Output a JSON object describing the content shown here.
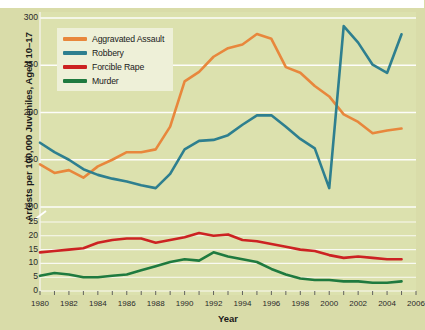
{
  "chart_data": {
    "type": "line",
    "title": "",
    "xlabel": "Year",
    "ylabel": "Arrests per 100,000 Juveniles, Aged 10–17",
    "xlim": [
      1980,
      2006
    ],
    "x_tick_labels": [
      "1980",
      "1982",
      "1984",
      "1986",
      "1988",
      "1990",
      "1992",
      "1994",
      "1996",
      "1998",
      "2000",
      "2002",
      "2004",
      "2006"
    ],
    "x_tick_values": [
      1980,
      1982,
      1984,
      1986,
      1988,
      1990,
      1992,
      1994,
      1996,
      1998,
      2000,
      2002,
      2004,
      2006
    ],
    "y_axis_break": true,
    "y_upper_ticks": [
      100,
      150,
      200,
      250,
      300
    ],
    "y_lower_ticks": [
      0,
      5,
      10,
      15,
      20,
      25
    ],
    "y_tick_labels_upper": [
      "100",
      "150",
      "200",
      "250",
      "300"
    ],
    "y_tick_labels_lower": [
      "0",
      "5",
      "10",
      "15",
      "20",
      "25"
    ],
    "grid": true,
    "grid_color": "#ffffff",
    "legend_position": "upper-left",
    "x": [
      1980,
      1981,
      1982,
      1983,
      1984,
      1985,
      1986,
      1987,
      1988,
      1989,
      1990,
      1991,
      1992,
      1993,
      1994,
      1995,
      1996,
      1997,
      1998,
      1999,
      2000,
      2001,
      2002,
      2003,
      2004,
      2005
    ],
    "series": [
      {
        "name": "Aggravated Assault",
        "color": "#e8873c",
        "values": [
          145,
          136,
          139,
          131,
          143,
          150,
          158,
          158,
          161,
          185,
          233,
          243,
          259,
          268,
          272,
          283,
          278,
          248,
          242,
          228,
          217,
          198,
          190,
          178,
          181,
          183
        ]
      },
      {
        "name": "Robbery",
        "color": "#2e7f8f",
        "values": [
          168,
          158,
          150,
          140,
          134,
          130,
          127,
          123,
          120,
          135,
          161,
          170,
          171,
          176,
          187,
          197,
          197,
          185,
          172,
          162,
          120,
          96,
          90,
          82,
          79,
          93
        ]
      },
      {
        "name": "Forcible Rape",
        "color": "#cc2222",
        "values": [
          14,
          14.5,
          15,
          15.5,
          17.5,
          18.5,
          19,
          19,
          17.5,
          18.5,
          19.5,
          21,
          20,
          20.5,
          18.5,
          18,
          17,
          16,
          15,
          14.5,
          13,
          12,
          12.5,
          12,
          11.5,
          11.5
        ]
      },
      {
        "name": "Murder",
        "color": "#1f7a3f",
        "values": [
          5.5,
          6.5,
          6,
          5,
          5,
          5.5,
          6,
          7.5,
          9,
          10.5,
          11.5,
          11,
          14,
          12.5,
          11.5,
          10.5,
          8,
          6,
          4.5,
          4,
          4,
          3.5,
          3.5,
          3,
          3,
          3.5
        ]
      }
    ]
  },
  "legend": {
    "items": [
      {
        "label": "Aggravated Assault",
        "color": "#e8873c"
      },
      {
        "label": "Robbery",
        "color": "#2e7f8f"
      },
      {
        "label": "Forcible Rape",
        "color": "#cc2222"
      },
      {
        "label": "Murder",
        "color": "#1f7a3f"
      }
    ]
  },
  "axes": {
    "y_title": "Arrests per 100,000 Juveniles, Aged 10–17",
    "x_title": "Year"
  }
}
